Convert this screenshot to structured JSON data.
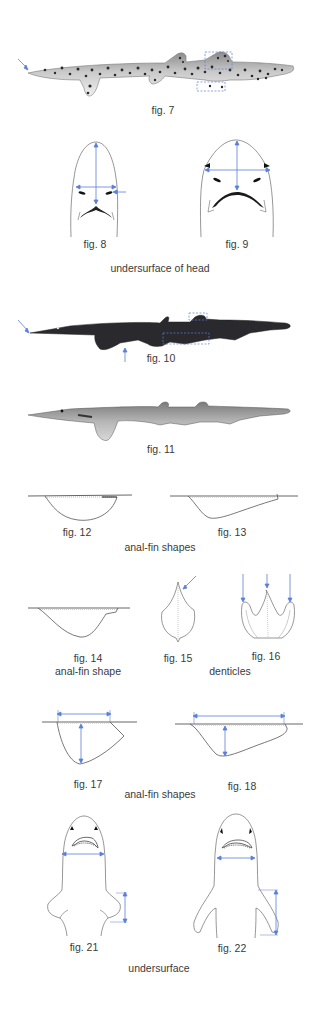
{
  "colors": {
    "annotation_blue": "#5b7fd6",
    "outline": "#6a6a6a",
    "caption": "#3a3a3a",
    "shark_dark": "#2a2a2e",
    "shark_light": "#b8b8b8"
  },
  "figures": {
    "fig7": {
      "label": "fig. 7",
      "subject": "spotted shark lateral view",
      "annotations": [
        "snout-arrow",
        "dorsal-fin-box",
        "anal-fin-box"
      ]
    },
    "fig8": {
      "label": "fig. 8",
      "subject": "head undersurface, narrow snout",
      "annotations": [
        "length-arrow",
        "width-arrow",
        "side-arrow"
      ]
    },
    "fig9": {
      "label": "fig. 9",
      "subject": "head undersurface, broad snout",
      "annotations": [
        "length-arrow",
        "width-arrow"
      ]
    },
    "fig10": {
      "label": "fig. 10",
      "subject": "dark long-snouted shark lateral view",
      "annotations": [
        "snout-arrow",
        "belly-arrow",
        "dorsal-fin-box",
        "anal-fin-box"
      ]
    },
    "fig11": {
      "label": "fig. 11",
      "subject": "pale long-snouted shark lateral view"
    },
    "fig12": {
      "label": "fig. 12",
      "subject": "rounded anal fin"
    },
    "fig13": {
      "label": "fig. 13",
      "subject": "long low anal fin"
    },
    "fig14": {
      "label": "fig. 14",
      "subject": "triangular anal fin"
    },
    "fig15": {
      "label": "fig. 15",
      "subject": "single-cusp denticle",
      "annotations": [
        "cusp-arrow"
      ]
    },
    "fig16": {
      "label": "fig. 16",
      "subject": "three-cusp denticle",
      "annotations": [
        "cusp-arrow-left",
        "cusp-arrow-center",
        "cusp-arrow-right"
      ]
    },
    "fig17": {
      "label": "fig. 17",
      "subject": "deep anal fin",
      "annotations": [
        "base-arrow",
        "height-arrow"
      ]
    },
    "fig18": {
      "label": "fig. 18",
      "subject": "long-base anal fin",
      "annotations": [
        "base-arrow",
        "height-arrow"
      ]
    },
    "fig21": {
      "label": "fig. 21",
      "subject": "undersurface with short pectoral fins",
      "annotations": [
        "mouth-width-arrow",
        "fin-length-arrow"
      ]
    },
    "fig22": {
      "label": "fig. 22",
      "subject": "undersurface with long pectoral fins",
      "annotations": [
        "mouth-width-arrow",
        "fin-length-arrow"
      ]
    }
  },
  "group_captions": {
    "head": "undersurface of head",
    "anal_fins_1": "anal-fin shapes",
    "anal_fin_single": "anal-fin shape",
    "denticles": "denticles",
    "anal_fins_2": "anal-fin shapes",
    "undersurface": "undersurface"
  }
}
